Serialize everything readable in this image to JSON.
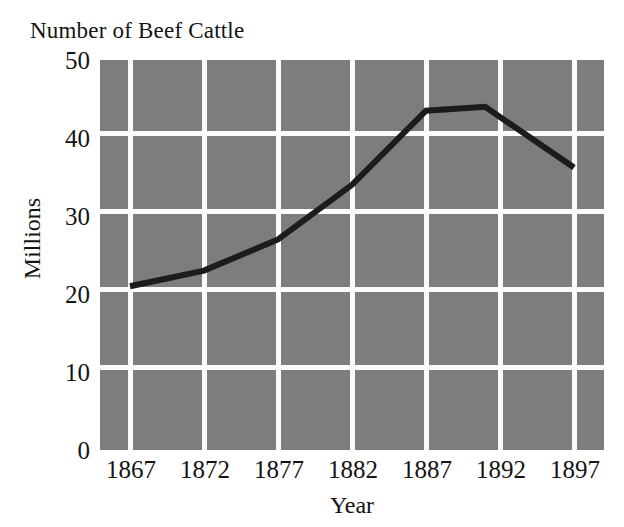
{
  "chart_data": {
    "type": "line",
    "title": "Number of Beef Cattle",
    "xlabel": "Year",
    "ylabel": "Millions",
    "x": [
      1867,
      1872,
      1877,
      1882,
      1887,
      1891,
      1897
    ],
    "categories": [
      "1867",
      "1872",
      "1877",
      "1882",
      "1887",
      "1892",
      "1897"
    ],
    "values": [
      21,
      23,
      27,
      34,
      43.5,
      44,
      36.2
    ],
    "series": [
      {
        "name": "Beef cattle",
        "values": [
          21,
          23,
          27,
          34,
          43.5,
          44,
          36.2
        ]
      }
    ],
    "xlim": [
      1867,
      1897
    ],
    "ylim": [
      0,
      50
    ],
    "xticks": [
      "1867",
      "1872",
      "1877",
      "1882",
      "1887",
      "1892",
      "1897"
    ],
    "yticks": [
      "0",
      "10",
      "20",
      "30",
      "40",
      "50"
    ],
    "grid": true,
    "legend": "none",
    "colors": {
      "plot_background": "#7d7d7d",
      "gridline": "#fbfbfb",
      "line": "#1c1c1c",
      "page_background": "#ffffff",
      "text": "#141414"
    }
  }
}
